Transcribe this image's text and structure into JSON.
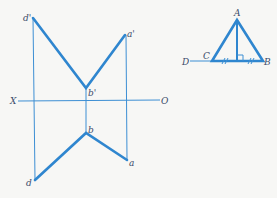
{
  "projection_diagram": {
    "axis": {
      "left_label": "X",
      "right_label": "O"
    },
    "front_view_points": {
      "d": "d'",
      "a": "a'",
      "b": "b'"
    },
    "top_view_points": {
      "b": "b",
      "a": "a",
      "d": "d"
    }
  },
  "triangle_diagram": {
    "apex": "A",
    "left_vertex": "C",
    "right_vertex": "B",
    "extension_point": "D",
    "equal_marks": [
      "//",
      "//"
    ]
  },
  "colors": {
    "line": "#2f86cf",
    "label": "#3a4b6a"
  }
}
